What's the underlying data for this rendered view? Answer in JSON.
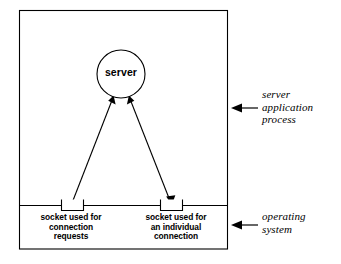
{
  "diagram": {
    "colors": {
      "stroke": "#000000",
      "background": "#ffffff",
      "text": "#000000"
    },
    "node": {
      "server": {
        "label": "server",
        "shape": "circle"
      }
    },
    "sockets": [
      {
        "id": "listening-socket",
        "caption_lines": [
          "socket used for",
          "connection",
          "requests"
        ],
        "shape": "rectangle"
      },
      {
        "id": "connection-socket",
        "caption_lines": [
          "socket used for",
          "an individual",
          "connection"
        ],
        "shape": "rectangle"
      }
    ],
    "annotations": [
      {
        "id": "server-application-process",
        "lines": [
          "server",
          "application",
          "process"
        ],
        "arrow": "arrow-left-icon"
      },
      {
        "id": "operating-system",
        "lines": [
          "operating",
          "system"
        ],
        "arrow": "arrow-left-icon"
      }
    ],
    "connectors": [
      {
        "id": "listening-socket-to-server",
        "from": "listening-socket",
        "to": "server",
        "arrowheads": [
          "at-server"
        ]
      },
      {
        "id": "server-to-connection-socket",
        "from": "server",
        "to": "connection-socket",
        "arrowheads": [
          "at-server",
          "at-socket"
        ]
      }
    ]
  }
}
